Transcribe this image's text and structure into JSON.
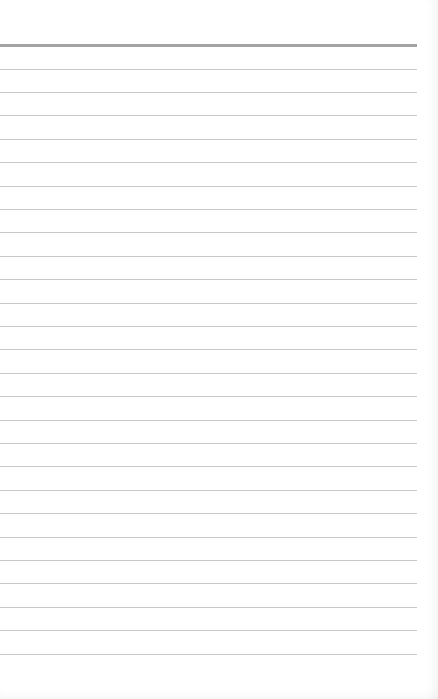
{
  "page": {
    "type": "lined-paper",
    "header_rule_y": 44,
    "first_rule_y": 68.5,
    "line_spacing": 23.4,
    "rule_count": 26,
    "rule_color": "#c9c9c9",
    "header_rule_color": "#a3a3a3",
    "background": "#ffffff",
    "lines": []
  }
}
